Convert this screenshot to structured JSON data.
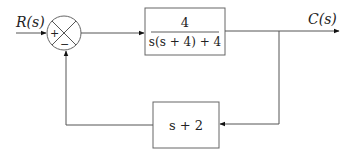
{
  "diagram": {
    "type": "closed-loop block diagram",
    "input": {
      "label": "R(s)"
    },
    "output": {
      "label": "C(s)"
    },
    "summing_junction": {
      "plus_sign": "+",
      "minus_sign": "−"
    },
    "forward_block": {
      "numerator": "4",
      "denominator": "s(s + 4) + 4"
    },
    "feedback_block": {
      "transfer_function": "s + 2"
    },
    "colors": {
      "line": "#555555",
      "box_border": "#666666",
      "text": "#222222"
    }
  }
}
